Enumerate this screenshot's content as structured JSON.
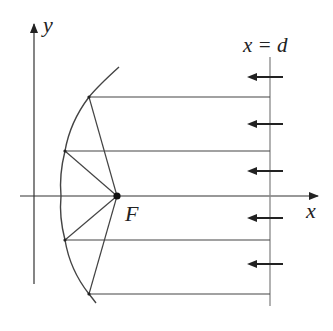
{
  "diagram": {
    "labels": {
      "y_axis": "y",
      "x_axis": "x",
      "focus": "F",
      "directrix": "x = d"
    },
    "colors": {
      "line": "#444444",
      "axis": "#333333",
      "directrix": "#888888",
      "arrow": "#222222",
      "focus_dot": "#111111"
    },
    "axes": {
      "y_axis": {
        "x": 34,
        "y_top": 22,
        "y_bottom": 284
      },
      "x_axis": {
        "y": 196,
        "x_left": 20,
        "x_right": 318
      }
    },
    "focus": {
      "x": 117,
      "y": 196
    },
    "directrix": {
      "x": 270,
      "y_top": 57,
      "y_bottom": 306
    },
    "rays": [
      {
        "y": 97,
        "mirror_x": 89
      },
      {
        "y": 151,
        "mirror_x": 65
      },
      {
        "y": 240,
        "mirror_x": 65
      },
      {
        "y": 294,
        "mirror_x": 89
      }
    ],
    "arrows_y": [
      77,
      124,
      171,
      218,
      264
    ],
    "arrow_direction": "left"
  }
}
